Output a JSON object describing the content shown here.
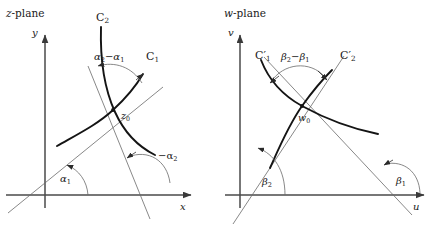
{
  "figure": {
    "stroke_color": "#1a1a1a",
    "axis_color": "#4a4a4a",
    "thin_line_color": "#5a5a5a",
    "background": "#ffffff"
  },
  "left_panel": {
    "title": "z-plane",
    "title_italic_part": "z",
    "title_rest": "-plane",
    "y_axis_label": "y",
    "x_axis_label": "x",
    "intersection_point_label": "z",
    "intersection_point_sub": "0",
    "curve1_label": "C",
    "curve1_sub": "1",
    "curve2_label": "C",
    "curve2_sub": "2",
    "angle_between_label_a2": "α",
    "angle_between_sub_a2": "2",
    "angle_between_minus": "−",
    "angle_between_label_a1": "α",
    "angle_between_sub_a1": "1",
    "angle_between_full": "α₂−α₁",
    "angle1_label": "α",
    "angle1_sub": "1",
    "angle2_label": "−α",
    "angle2_sub": "2",
    "angle2_full": "−α₂"
  },
  "right_panel": {
    "title": "w-plane",
    "title_italic_part": "w",
    "title_rest": "-plane",
    "y_axis_label": "v",
    "x_axis_label": "u",
    "intersection_point_label": "w",
    "intersection_point_sub": "0",
    "curve1_label": "C",
    "curve1_prime": "′",
    "curve1_sub": "1",
    "curve2_label": "C",
    "curve2_prime": "′",
    "curve2_sub": "2",
    "angle_between_label_b2": "β",
    "angle_between_sub_b2": "2",
    "angle_between_minus": "−",
    "angle_between_label_b1": "β",
    "angle_between_sub_b1": "1",
    "angle_between_full": "β₂−β₁",
    "angle1_label": "β",
    "angle1_sub": "1",
    "angle2_label": "β",
    "angle2_sub": "2"
  }
}
